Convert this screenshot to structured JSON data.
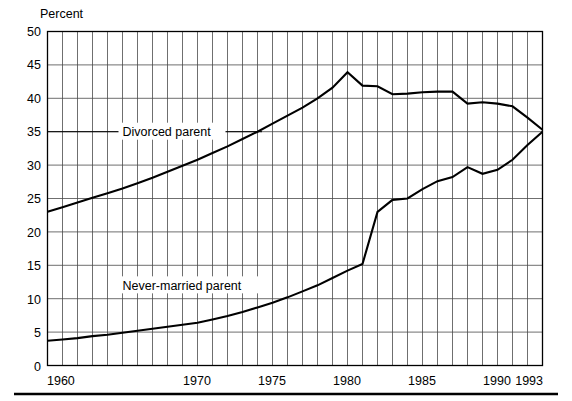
{
  "chart_data": {
    "type": "line",
    "title": "",
    "ylabel": "Percent",
    "xlabel": "",
    "ylim": [
      0,
      50
    ],
    "yticks": [
      0,
      5,
      10,
      15,
      20,
      25,
      30,
      35,
      40,
      45,
      50
    ],
    "xlim": [
      1960,
      1993
    ],
    "xticks": [
      1960,
      1970,
      1975,
      1980,
      1985,
      1990,
      1993
    ],
    "xtick_labels": [
      "1960",
      "1970",
      "1975",
      "1980",
      "1985",
      "1990",
      "1993"
    ],
    "grid": "vertical gridlines every year; horizontal gridlines every 5 percent",
    "legend_position": "inline annotations on plot",
    "x": [
      1960,
      1961,
      1962,
      1963,
      1964,
      1965,
      1966,
      1967,
      1968,
      1969,
      1970,
      1971,
      1972,
      1973,
      1974,
      1975,
      1976,
      1977,
      1978,
      1979,
      1980,
      1981,
      1982,
      1983,
      1984,
      1985,
      1986,
      1987,
      1988,
      1989,
      1990,
      1991,
      1992,
      1993
    ],
    "series": [
      {
        "name": "Divorced parent",
        "label": "Divorced parent",
        "values": [
          23.0,
          23.7,
          24.4,
          25.1,
          25.8,
          26.5,
          27.3,
          28.1,
          29.0,
          29.9,
          30.8,
          31.8,
          32.8,
          33.9,
          35.0,
          36.2,
          37.4,
          38.6,
          40.0,
          41.6,
          43.9,
          41.9,
          41.8,
          40.6,
          40.7,
          40.9,
          41.0,
          41.0,
          39.2,
          39.4,
          39.2,
          38.8,
          37.1,
          35.3
        ]
      },
      {
        "name": "Never-married parent",
        "label": "Never-married parent",
        "values": [
          3.7,
          3.9,
          4.1,
          4.4,
          4.6,
          4.9,
          5.2,
          5.5,
          5.8,
          6.1,
          6.4,
          6.9,
          7.4,
          8.0,
          8.7,
          9.4,
          10.2,
          11.1,
          12.0,
          13.1,
          14.2,
          15.2,
          23.0,
          24.8,
          25.0,
          26.4,
          27.6,
          28.2,
          29.7,
          28.7,
          29.3,
          30.8,
          33.0,
          35.0
        ]
      }
    ],
    "annotations": [
      {
        "text": "Divorced parent",
        "series": "Divorced parent",
        "x": 1965,
        "y": 35
      },
      {
        "text": "Never-married parent",
        "series": "Never-married parent",
        "x": 1965,
        "y": 12
      }
    ]
  },
  "axes": {
    "y_axis_title": "Percent"
  }
}
